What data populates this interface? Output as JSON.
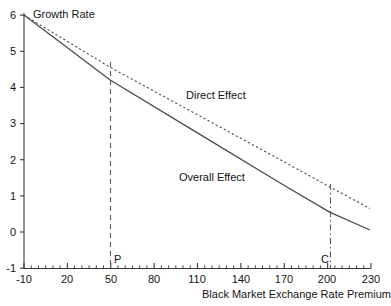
{
  "chart_data": {
    "type": "line",
    "title": "",
    "xlabel": "Black Market Exchange Rate Premium",
    "ylabel": "Growth Rate",
    "xlim": [
      -10,
      230
    ],
    "ylim": [
      -1,
      6
    ],
    "grid": false,
    "legend_position": "inline-annotation",
    "xticks": [
      -10,
      20,
      50,
      80,
      110,
      140,
      170,
      200,
      230
    ],
    "xtick_labels": [
      "-10",
      "20",
      "50",
      "80",
      "110",
      "140",
      "170",
      "200",
      "230"
    ],
    "xminor_step": 5,
    "yticks": [
      -1,
      0,
      1,
      2,
      3,
      4,
      5,
      6
    ],
    "ytick_labels": [
      "-1",
      "0",
      "1",
      "2",
      "3",
      "4",
      "5",
      "6"
    ],
    "series": [
      {
        "name": "Direct Effect",
        "style": "dotted",
        "x": [
          -10,
          50,
          110,
          170,
          202,
          230
        ],
        "values": [
          6.0,
          4.55,
          3.25,
          1.95,
          1.25,
          0.65
        ]
      },
      {
        "name": "Overall Effect",
        "style": "solid",
        "x": [
          -10,
          50,
          110,
          170,
          202,
          230
        ],
        "values": [
          6.0,
          4.2,
          2.75,
          1.3,
          0.55,
          0.05
        ]
      }
    ],
    "annotations": [
      {
        "name": "Direct Effect",
        "label": "Direct Effect",
        "x": 112,
        "y": 3.55
      },
      {
        "name": "Overall Effect",
        "label": "Overall Effect",
        "x": 104,
        "y": 1.35
      }
    ],
    "vertical_markers": [
      {
        "name": "P",
        "label": "P",
        "x": 50,
        "style": "dashed",
        "y_top": 4.6,
        "y_bottom": -1
      },
      {
        "name": "C",
        "label": "C",
        "x": 202,
        "style": "dash-dot",
        "y_top": 1.3,
        "y_bottom": -1
      }
    ]
  },
  "axes": {
    "y_title": "Growth Rate",
    "x_title": "Black Market Exchange Rate Premium",
    "y_ticks": [
      "6",
      "5",
      "4",
      "3",
      "2",
      "1",
      "0",
      "-1"
    ],
    "x_ticks": [
      "-10",
      "20",
      "50",
      "80",
      "110",
      "140",
      "170",
      "200",
      "230"
    ]
  },
  "series_labels": {
    "direct": "Direct Effect",
    "overall": "Overall Effect"
  },
  "markers": {
    "p": "P",
    "c": "C"
  },
  "colors": {
    "axis": "#3a3a3a",
    "line": "#4a4a4a",
    "marker": "#5a5a5a",
    "text": "#141414",
    "background": "#ffffff"
  }
}
